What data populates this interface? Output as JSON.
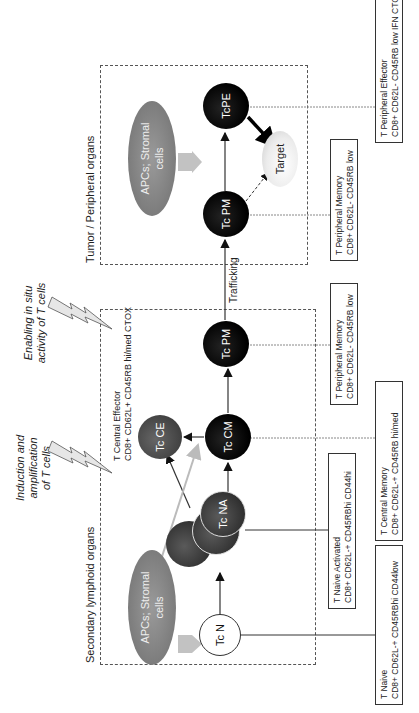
{
  "regions": {
    "secondary_lymphoid": {
      "label": "Secondary lymphoid organs"
    },
    "tumor_peripheral": {
      "label": "Tumor / Peripheral organs"
    }
  },
  "captions": {
    "induction": [
      "Induction and",
      "amplification",
      "of T cells"
    ],
    "enabling": [
      "Enabling in situ",
      "activity of T cells"
    ]
  },
  "apcs": {
    "left": {
      "line1": "APCs; Stromal",
      "line2": "cells"
    },
    "right": {
      "line1": "APCs; Stromal",
      "line2": "cells"
    }
  },
  "cells": {
    "tc_n": "Tc N",
    "tc_na": "Tc NA",
    "tc_cm": "Tc CM",
    "tc_ce": "Tc CE",
    "tc_pm_lymphoid": "Tc PM",
    "tc_pm_tumor": "Tc PM",
    "tc_pe": "TcPE",
    "target": "Target"
  },
  "edges": {
    "trafficking": "Trafficking"
  },
  "central_effector_label": {
    "title": "T Central Effector",
    "markers": "CD8+ CD62L+  CD45RB hi/med  CTOX"
  },
  "info_boxes": [
    {
      "id": "naive",
      "title": "T Naive",
      "markers": "CD8+ CD62L-+ CD45RBhi  CD44low"
    },
    {
      "id": "naive_activated",
      "title": "T Naive Activated",
      "markers": "CD8+ CD62L-+ CD45RBhi  CD44hi"
    },
    {
      "id": "central_memory",
      "title": "T Central Memory",
      "markers": "CD8+ CD62L-+ CD45RB  hi/med"
    },
    {
      "id": "peripheral_memory_lymphoid",
      "title": "T Peripheral Memory",
      "markers": "CD8+ CD62L-  CD45RB low"
    },
    {
      "id": "peripheral_memory_tumor",
      "title": "T Peripheral Memory",
      "markers": "CD8+ CD62L-  CD45RB low"
    },
    {
      "id": "peripheral_effector",
      "title": "T Peripheral Effector",
      "markers": "CD8+ CD62L-  CD45RB low  IFN CTOX"
    }
  ],
  "colors": {
    "cell_black": "#000000",
    "cell_dark": "#3a3a3a",
    "apc_grey": "#8a8a8a",
    "arrow_grey": "#bdbdbd",
    "line": "#333333"
  }
}
